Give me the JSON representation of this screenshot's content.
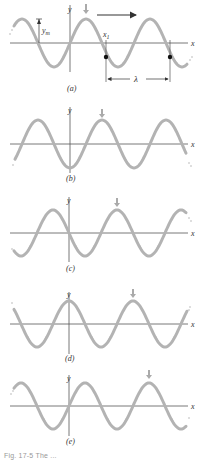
{
  "figure": {
    "wave_color": "#b3b3b3",
    "axis_color": "#555555",
    "arrow_color": "#aaaaaa",
    "axis_label_x": "x",
    "axis_label_y": "y",
    "panels": [
      {
        "id": "a",
        "label": "(a)",
        "phase_note": "initial snapshot",
        "marker_arrow": "down-arrow over crest",
        "annotations": {
          "amplitude": "y",
          "amplitude_sub": "m",
          "position": "x",
          "position_sub": "1",
          "wavelength": "λ",
          "direction": "travel direction arrow →"
        }
      },
      {
        "id": "b",
        "label": "(b)"
      },
      {
        "id": "c",
        "label": "(c)"
      },
      {
        "id": "d",
        "label": "(d)"
      },
      {
        "id": "e",
        "label": "(e)"
      }
    ],
    "caption": "Fig. 17-5 The ..."
  }
}
